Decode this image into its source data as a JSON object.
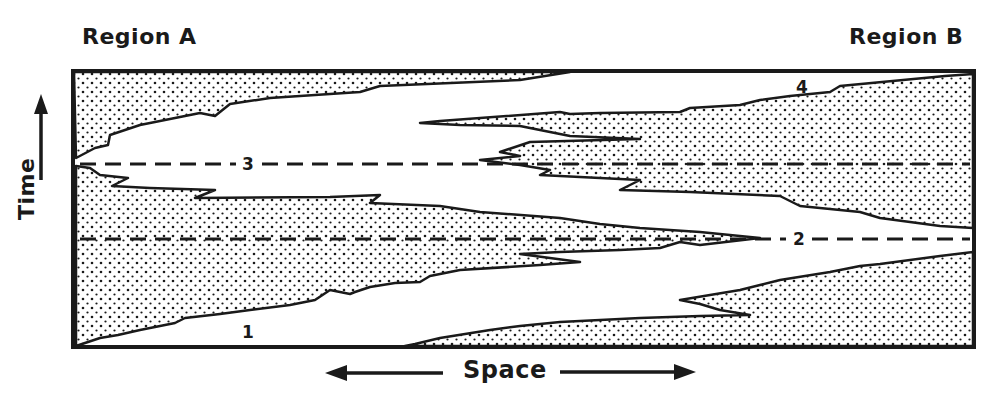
{
  "labels": {
    "region_left": "Region A",
    "region_right": "Region B",
    "y_axis": "Time",
    "x_axis": "Space"
  },
  "markers": {
    "m1": "1",
    "m2": "2",
    "m3": "3",
    "m4": "4"
  },
  "colors": {
    "ink": "#1a1a1a",
    "paper": "#ffffff"
  }
}
